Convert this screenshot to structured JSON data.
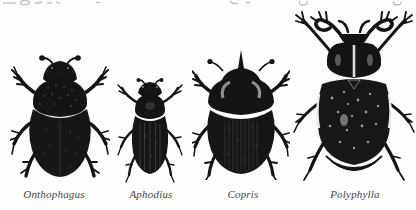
{
  "page": {
    "paper_color": "#fdfdfb",
    "ink_color": "#141414",
    "caption_color": "#474747"
  },
  "figure": {
    "specimens": [
      {
        "label": "Onthophagus"
      },
      {
        "label": "Aphodius"
      },
      {
        "label": "Copris"
      },
      {
        "label": "Polyphylla"
      }
    ]
  }
}
